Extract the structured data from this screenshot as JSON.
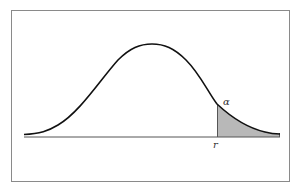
{
  "diagram": {
    "type": "normal-distribution-right-tail",
    "labels": {
      "alpha": "α",
      "cutoff": "r"
    },
    "colors": {
      "curve": "#111111",
      "shade": "#b8b8b8",
      "frame": "#8a8a8a",
      "baseline": "#555555"
    }
  }
}
